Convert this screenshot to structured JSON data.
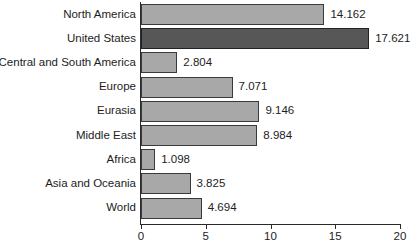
{
  "chart_data": {
    "type": "bar",
    "orientation": "horizontal",
    "title": "",
    "xlabel": "",
    "ylabel": "",
    "xlim": [
      0,
      20
    ],
    "grid": false,
    "legend": null,
    "categories": [
      "North America",
      "United States",
      "Central and South America",
      "Europe",
      "Eurasia",
      "Middle East",
      "Africa",
      "Asia and Oceania",
      "World"
    ],
    "values": [
      14.162,
      17.621,
      2.804,
      7.071,
      9.146,
      8.984,
      1.098,
      3.825,
      4.694
    ],
    "value_labels": [
      "14.162",
      "17.621",
      "2.804",
      "7.071",
      "9.146",
      "8.984",
      "1.098",
      "3.825",
      "4.694"
    ],
    "highlight_index": 1,
    "xticks": [
      0,
      5,
      10,
      15,
      20
    ],
    "xtick_labels": [
      "0",
      "5",
      "10",
      "15",
      "20"
    ],
    "colors": {
      "bar_fill": "#a8a8a8",
      "bar_highlight_fill": "#575757",
      "bar_stroke": "#3a3a3a",
      "axis": "#2b2b2b",
      "text": "#1d1d1d",
      "background": "#ffffff"
    }
  }
}
